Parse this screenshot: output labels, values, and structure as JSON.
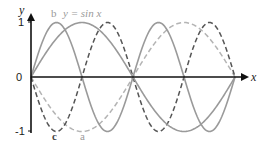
{
  "chart_data": {
    "type": "line",
    "title": "",
    "xlabel": "x",
    "ylabel": "y",
    "xlim": [
      0,
      6.2832
    ],
    "ylim": [
      -1,
      1
    ],
    "grid": false,
    "legend_position": "inline",
    "y_ticks": [
      {
        "value": 1,
        "label": "1"
      },
      {
        "value": 0,
        "label": "0"
      },
      {
        "value": -1,
        "label": "-1"
      }
    ],
    "series": [
      {
        "name": "y = sin x",
        "function": "sin(x)",
        "style": "solid",
        "color": "#9a9a9a",
        "x": [
          0,
          0.7854,
          1.5708,
          2.3562,
          3.1416,
          3.927,
          4.7124,
          5.4978,
          6.2832
        ],
        "values": [
          0,
          0.707,
          1,
          0.707,
          0,
          -0.707,
          -1,
          -0.707,
          0
        ]
      },
      {
        "name": "a",
        "function": "-sin(x)",
        "style": "dashed",
        "color": "#b4b4b4",
        "x": [
          0,
          0.7854,
          1.5708,
          2.3562,
          3.1416,
          3.927,
          4.7124,
          5.4978,
          6.2832
        ],
        "values": [
          0,
          -0.707,
          -1,
          -0.707,
          0,
          0.707,
          1,
          0.707,
          0
        ]
      },
      {
        "name": "b",
        "function": "sin(2x)",
        "style": "solid",
        "color": "#9a9a9a",
        "x": [
          0,
          0.7854,
          1.5708,
          2.3562,
          3.1416,
          3.927,
          4.7124,
          5.4978,
          6.2832
        ],
        "values": [
          0,
          1,
          0,
          -1,
          0,
          1,
          0,
          -1,
          0
        ]
      },
      {
        "name": "c",
        "function": "-sin(2x)",
        "style": "dashed",
        "color": "#555555",
        "x": [
          0,
          0.7854,
          1.5708,
          2.3562,
          3.1416,
          3.927,
          4.7124,
          5.4978,
          6.2832
        ],
        "values": [
          0,
          -1,
          0,
          1,
          0,
          -1,
          0,
          1,
          0
        ]
      }
    ],
    "annotations": [
      {
        "text": "b",
        "series": "b",
        "position": "top-left"
      },
      {
        "text": "y = sin x",
        "series": "y = sin x",
        "position": "top"
      },
      {
        "text": "c",
        "series": "c",
        "position": "bottom-left"
      },
      {
        "text": "a",
        "series": "a",
        "position": "bottom"
      }
    ]
  },
  "labels": {
    "y_axis": "y",
    "x_axis": "x",
    "tick_1": "1",
    "tick_0": "0",
    "tick_neg1": "-1",
    "b": "b",
    "sin_eq_prefix": "y = sin ",
    "sin_eq_var": "x",
    "c": "c",
    "a": "a"
  },
  "colors": {
    "axis": "#111111",
    "solid_gray": "#9a9a9a",
    "light_dashed": "#b4b4b4",
    "dark_dashed": "#555555",
    "label_gray": "#9a9a9a",
    "label_dark": "#444444"
  }
}
